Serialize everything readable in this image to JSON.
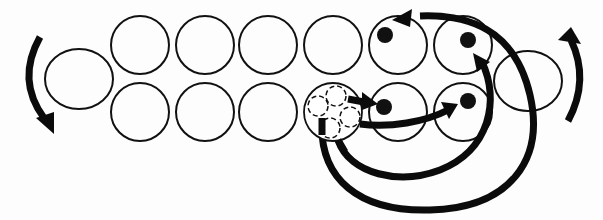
{
  "diagram": {
    "title": "",
    "background": "#fdfdfd",
    "stroke_color": "#111111",
    "top_row": {
      "y": 45,
      "radius": 30,
      "slots": [
        {
          "id": "t1",
          "cx": 140
        },
        {
          "id": "t2",
          "cx": 205
        },
        {
          "id": "t3",
          "cx": 268
        },
        {
          "id": "t4",
          "cx": 333
        },
        {
          "id": "t5",
          "cx": 398,
          "token": true
        },
        {
          "id": "t6",
          "cx": 463,
          "token": true
        }
      ]
    },
    "bottom_row": {
      "y": 112,
      "radius": 30,
      "slots": [
        {
          "id": "b1",
          "cx": 140
        },
        {
          "id": "b2",
          "cx": 205
        },
        {
          "id": "b3",
          "cx": 268
        },
        {
          "id": "b4",
          "cx": 333,
          "cluster": true,
          "sub_slots": 4
        },
        {
          "id": "b5",
          "cx": 398,
          "token": true
        },
        {
          "id": "b6",
          "cx": 463,
          "token": true
        }
      ]
    },
    "end_caps": [
      {
        "id": "left-end",
        "cx": 79,
        "cy": 79,
        "rx": 34,
        "ry": 30
      },
      {
        "id": "right-end",
        "cx": 528,
        "cy": 81,
        "rx": 34,
        "ry": 30
      }
    ],
    "tokens": [
      {
        "id": "dot-top-5",
        "cx": 385,
        "cy": 35
      },
      {
        "id": "dot-top-6",
        "cx": 468,
        "cy": 40
      },
      {
        "id": "dot-bottom-5",
        "cx": 384,
        "cy": 107
      },
      {
        "id": "dot-bottom-6",
        "cx": 468,
        "cy": 101
      }
    ],
    "rotation_arrows": [
      {
        "id": "left-rotation",
        "direction": "counterclockwise-down"
      },
      {
        "id": "right-rotation",
        "direction": "counterclockwise-up"
      }
    ],
    "transfer_arrows": [
      {
        "from": "b4",
        "to": "b5"
      },
      {
        "from": "b4",
        "to": "b6"
      },
      {
        "from": "b4",
        "to": "t6"
      },
      {
        "from": "b4",
        "to": "t5"
      }
    ]
  }
}
